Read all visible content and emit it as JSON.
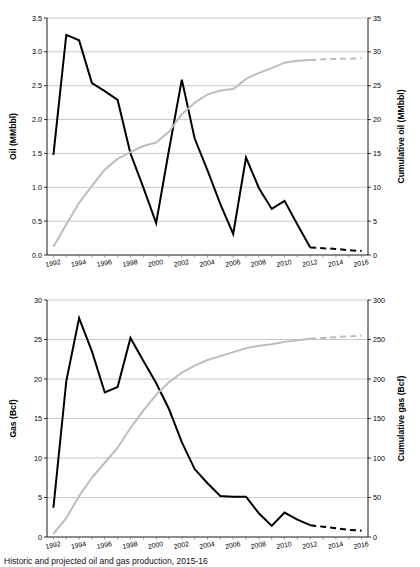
{
  "figure": {
    "caption": "Historic and projected oil and gas production, 2015-16"
  },
  "chart_data": [
    {
      "id": "oil",
      "type": "line",
      "title": "",
      "xlabel": "",
      "ylabel": "Oil (MMbbl)",
      "y2label": "Cumulative oil (MMbbl)",
      "xlim": [
        1991.5,
        2016.5
      ],
      "ylim": [
        0.0,
        3.5
      ],
      "y2lim": [
        0,
        35
      ],
      "yticks": [
        "0.0",
        "0.5",
        "1.0",
        "1.5",
        "2.0",
        "2.5",
        "3.0",
        "3.5"
      ],
      "y2ticks": [
        "0",
        "5",
        "10",
        "15",
        "20",
        "25",
        "30",
        "35"
      ],
      "xticks": [
        "1992",
        "1994",
        "1996",
        "1998",
        "2000",
        "2002",
        "2004",
        "2006",
        "2008",
        "2010",
        "2012",
        "2014",
        "2016"
      ],
      "grid": true,
      "legend_position": "none",
      "series": [
        {
          "name": "Oil production",
          "axis": "left",
          "color": "#000000",
          "style": "solid",
          "x": [
            1992,
            1993,
            1994,
            1995,
            1996,
            1997,
            1998,
            1999,
            2000,
            2001,
            2002,
            2003,
            2004,
            2005,
            2006,
            2007,
            2008,
            2009,
            2010,
            2011,
            2012
          ],
          "values": [
            1.48,
            3.25,
            3.17,
            2.54,
            2.42,
            2.29,
            1.5,
            1.0,
            0.47,
            1.55,
            2.59,
            1.72,
            1.25,
            0.75,
            0.31,
            1.44,
            0.99,
            0.68,
            0.8,
            0.45,
            0.11
          ]
        },
        {
          "name": "Oil production (projected)",
          "axis": "left",
          "color": "#000000",
          "style": "dashed",
          "x": [
            2012,
            2013,
            2014,
            2015,
            2016
          ],
          "values": [
            0.11,
            0.1,
            0.09,
            0.07,
            0.06
          ]
        },
        {
          "name": "Cumulative oil",
          "axis": "right",
          "color": "#bdbdbd",
          "style": "solid",
          "x": [
            1992,
            1993,
            1994,
            1995,
            1996,
            1997,
            1998,
            1999,
            2000,
            2001,
            2002,
            2003,
            2004,
            2005,
            2006,
            2007,
            2008,
            2009,
            2010,
            2011,
            2012
          ],
          "values": [
            1.2,
            4.5,
            7.7,
            10.2,
            12.6,
            14.2,
            15.2,
            16.1,
            16.6,
            18.2,
            20.8,
            22.5,
            23.7,
            24.3,
            24.5,
            26.0,
            26.9,
            27.6,
            28.4,
            28.7,
            28.8
          ]
        },
        {
          "name": "Cumulative oil (projected)",
          "axis": "right",
          "color": "#bdbdbd",
          "style": "dashed",
          "x": [
            2012,
            2013,
            2014,
            2015,
            2016
          ],
          "values": [
            28.8,
            28.9,
            28.95,
            29.0,
            29.05
          ]
        }
      ]
    },
    {
      "id": "gas",
      "type": "line",
      "title": "",
      "xlabel": "",
      "ylabel": "Gas (Bcf)",
      "y2label": "Cumulative gas (Bcf)",
      "xlim": [
        1991.5,
        2016.5
      ],
      "ylim": [
        0,
        30
      ],
      "y2lim": [
        0,
        300
      ],
      "yticks": [
        "0",
        "5",
        "10",
        "15",
        "20",
        "25",
        "30"
      ],
      "y2ticks": [
        "0",
        "50",
        "100",
        "150",
        "200",
        "250",
        "300"
      ],
      "xticks": [
        "1992",
        "1994",
        "1996",
        "1998",
        "2000",
        "2002",
        "2004",
        "2006",
        "2008",
        "2010",
        "2012",
        "2014",
        "2016"
      ],
      "grid": true,
      "legend_position": "none",
      "series": [
        {
          "name": "Gas production",
          "axis": "left",
          "color": "#000000",
          "style": "solid",
          "x": [
            1992,
            1993,
            1994,
            1995,
            1996,
            1997,
            1998,
            1999,
            2000,
            2001,
            2002,
            2003,
            2004,
            2005,
            2006,
            2007,
            2008,
            2009,
            2010,
            2011,
            2012
          ],
          "values": [
            3.7,
            19.7,
            27.7,
            23.5,
            18.3,
            19.0,
            25.2,
            22.3,
            19.5,
            16.2,
            12.0,
            8.6,
            6.8,
            5.2,
            5.1,
            5.1,
            3.0,
            1.4,
            3.1,
            2.2,
            1.5
          ]
        },
        {
          "name": "Gas production (projected)",
          "axis": "left",
          "color": "#000000",
          "style": "dashed",
          "x": [
            2012,
            2013,
            2014,
            2015,
            2016
          ],
          "values": [
            1.5,
            1.3,
            1.1,
            0.9,
            0.8
          ]
        },
        {
          "name": "Cumulative gas",
          "axis": "right",
          "color": "#bdbdbd",
          "style": "solid",
          "x": [
            1992,
            1993,
            1994,
            1995,
            1996,
            1997,
            1998,
            1999,
            2000,
            2001,
            2002,
            2003,
            2004,
            2005,
            2006,
            2007,
            2008,
            2009,
            2010,
            2011,
            2012
          ],
          "values": [
            4,
            24,
            52,
            75,
            94,
            113,
            138,
            160,
            180,
            196,
            208,
            217,
            224,
            229,
            234,
            239,
            242,
            244,
            247,
            249,
            251
          ]
        },
        {
          "name": "Cumulative gas (projected)",
          "axis": "right",
          "color": "#bdbdbd",
          "style": "dashed",
          "x": [
            2012,
            2013,
            2014,
            2015,
            2016
          ],
          "values": [
            251,
            252,
            253,
            254,
            255
          ]
        }
      ]
    }
  ]
}
